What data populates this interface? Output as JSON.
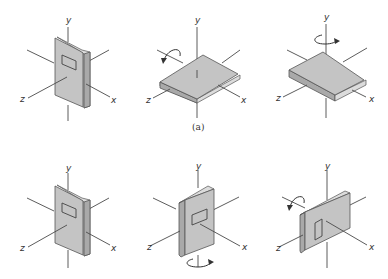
{
  "figure": {
    "axis_labels": {
      "x": "x",
      "y": "y",
      "z": "z"
    },
    "caption_top_row": "(a)",
    "rows": [
      {
        "label": "(a)",
        "panels": [
          {
            "state": "initial",
            "orientation": "upright, cover facing +z",
            "rotation_arrow": "none"
          },
          {
            "state": "after rotation about x",
            "orientation": "lying flat",
            "rotation_arrow": "about x-axis"
          },
          {
            "state": "after rotation about y",
            "orientation": "lying flat, turned",
            "rotation_arrow": "about y-axis"
          }
        ]
      },
      {
        "label": "",
        "panels": [
          {
            "state": "initial",
            "orientation": "upright, cover facing +z",
            "rotation_arrow": "none"
          },
          {
            "state": "after rotation about y",
            "orientation": "upright, turned toward +x",
            "rotation_arrow": "about y-axis"
          },
          {
            "state": "after rotation about x",
            "orientation": "on its side",
            "rotation_arrow": "about x-axis"
          }
        ]
      }
    ]
  },
  "colors": {
    "cover": "#c4c4c4",
    "spine": "#a9a9a9",
    "pages": "#dcdcdc",
    "lines": "#4a4a4a",
    "background": "#ffffff"
  }
}
